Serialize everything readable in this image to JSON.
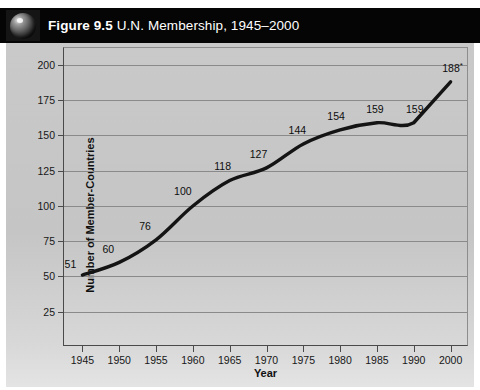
{
  "title": {
    "figure_label": "Figure 9.5",
    "figure_rest": " U.N. Membership, 1945–2000",
    "icon": "globe-icon"
  },
  "colors": {
    "title_bar_background": "#050505",
    "title_text": "#ffffff",
    "panel_background": "#c7c7c7",
    "gridline": "#8a8a8a",
    "axis": "#4a4a4a",
    "series_line": "#141414"
  },
  "chart_data": {
    "type": "line",
    "title": "Figure 9.5 U.N. Membership, 1945–2000",
    "xlabel": "Year",
    "ylabel": "Number of Member-Countries",
    "categories": [
      "1945",
      "1950",
      "1955",
      "1960",
      "1965",
      "1970",
      "1975",
      "1980",
      "1985",
      "1990",
      "2000"
    ],
    "values": [
      51,
      60,
      76,
      100,
      118,
      127,
      144,
      154,
      159,
      159,
      188
    ],
    "point_labels": [
      "51",
      "60",
      "76",
      "100",
      "118",
      "127",
      "144",
      "154",
      "159",
      "159",
      "188*"
    ],
    "ylim": [
      0,
      212
    ],
    "yticks": [
      25,
      50,
      75,
      100,
      125,
      150,
      175,
      200
    ],
    "ytick_labels": [
      "25",
      "50",
      "75",
      "100",
      "125",
      "150",
      "175",
      "200"
    ],
    "grid": true,
    "legend": "none",
    "smoothed": true,
    "annotation": "188*"
  }
}
